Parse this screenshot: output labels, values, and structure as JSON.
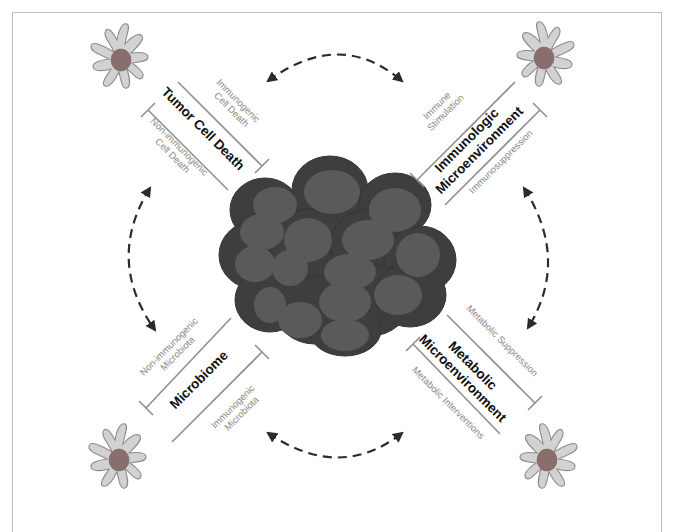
{
  "figure": {
    "center": {
      "label": "tumor-cell-cluster"
    },
    "colors": {
      "title_text": "#111111",
      "sub_label_text": "#8a8a8a",
      "inhibition_bar": "#8f8f8f",
      "dashed_arrow": "#2b2b2b",
      "dendritic_cell_body": "#d2d2d2",
      "dendritic_cell_nucleus": "#8a6d6d",
      "tumor_cell_rim": "#3e3e3e",
      "tumor_cell_core": "#5a5a5a"
    }
  },
  "quadrants": {
    "top_left": {
      "title": "Tumor Cell Death",
      "upper_label_line1": "Immunogenic",
      "upper_label_line2": "Cell Death",
      "lower_label_line1": "Non-immunogenic",
      "lower_label_line2": "Cell Death"
    },
    "top_right": {
      "title_line1": "Immunologic",
      "title_line2": "Microenvironment",
      "upper_label_line1": "Immune",
      "upper_label_line2": "Stimulation",
      "lower_label": "Immunosuppression"
    },
    "bottom_left": {
      "title": "Microbiome",
      "upper_label_line1": "Non-immunogenic",
      "upper_label_line2": "Microbiota",
      "lower_label_line1": "Immunogenic",
      "lower_label_line2": "Microbiota"
    },
    "bottom_right": {
      "title_line1": "Metabolic",
      "title_line2": "Microenvironment",
      "upper_label": "Metabolic Suppression",
      "lower_label": "Metabolic Interventions"
    }
  },
  "arrows": [
    {
      "position": "top",
      "type": "bidirectional-dashed"
    },
    {
      "position": "right",
      "type": "bidirectional-dashed"
    },
    {
      "position": "bottom",
      "type": "bidirectional-dashed"
    },
    {
      "position": "left",
      "type": "bidirectional-dashed"
    }
  ]
}
